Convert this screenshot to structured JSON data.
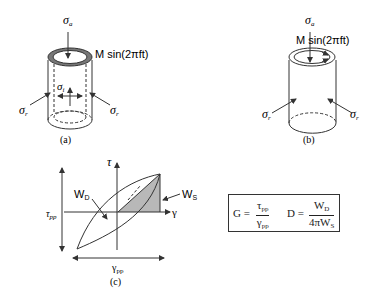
{
  "panels": {
    "a": {
      "caption": "(a)",
      "axial_stress": "σ",
      "axial_sub": "a",
      "torque_label": "M sin(2πft)",
      "radial_left": "σ",
      "radial_left_sub": "r",
      "radial_right": "σ",
      "radial_right_sub": "r",
      "inner_stress": "σ",
      "inner_sub": "i"
    },
    "b": {
      "caption": "(b)",
      "axial_stress": "σ",
      "axial_sub": "a",
      "torque_label": "M sin(2πft)",
      "radial_left": "σ",
      "radial_left_sub": "r",
      "radial_right": "σ",
      "radial_right_sub": "r"
    },
    "c": {
      "caption": "(c)",
      "y_axis": "τ",
      "x_axis": "γ",
      "tau_pp": "τ",
      "tau_pp_sub": "pp",
      "gamma_pp": "γ",
      "gamma_pp_sub": "pp",
      "wd": "W",
      "wd_sub": "D",
      "ws": "W",
      "ws_sub": "S"
    }
  },
  "formulas": {
    "g_lhs": "G =",
    "g_num": "τ",
    "g_num_sub": "pp",
    "g_den": "γ",
    "g_den_sub": "pp",
    "d_lhs": "D =",
    "d_num": "W",
    "d_num_sub": "D",
    "d_den": "4πW",
    "d_den_sub": "S"
  },
  "colors": {
    "line": "#333333",
    "shade": "#b8b8b8",
    "ring": "#555555"
  }
}
